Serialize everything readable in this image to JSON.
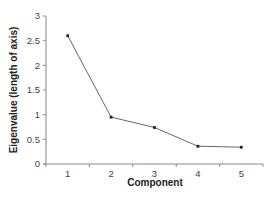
{
  "chart_data": {
    "type": "line",
    "title": "",
    "xlabel": "Component",
    "ylabel": "Eigenvalue (length of axis)",
    "categories": [
      "1",
      "2",
      "3",
      "4",
      "5"
    ],
    "series": [
      {
        "name": "Eigenvalue",
        "values": [
          2.6,
          0.95,
          0.74,
          0.36,
          0.34
        ]
      }
    ],
    "ylim": [
      0,
      3
    ],
    "yticks": [
      "0",
      "0.5",
      "1",
      "1.5",
      "2",
      "2.5",
      "3"
    ],
    "ytick_values": [
      0,
      0.5,
      1,
      1.5,
      2,
      2.5,
      3
    ],
    "grid": false,
    "legend": "none",
    "colors": {
      "line": "#555555",
      "marker": "#222222",
      "axis": "#8a8a8a"
    }
  }
}
